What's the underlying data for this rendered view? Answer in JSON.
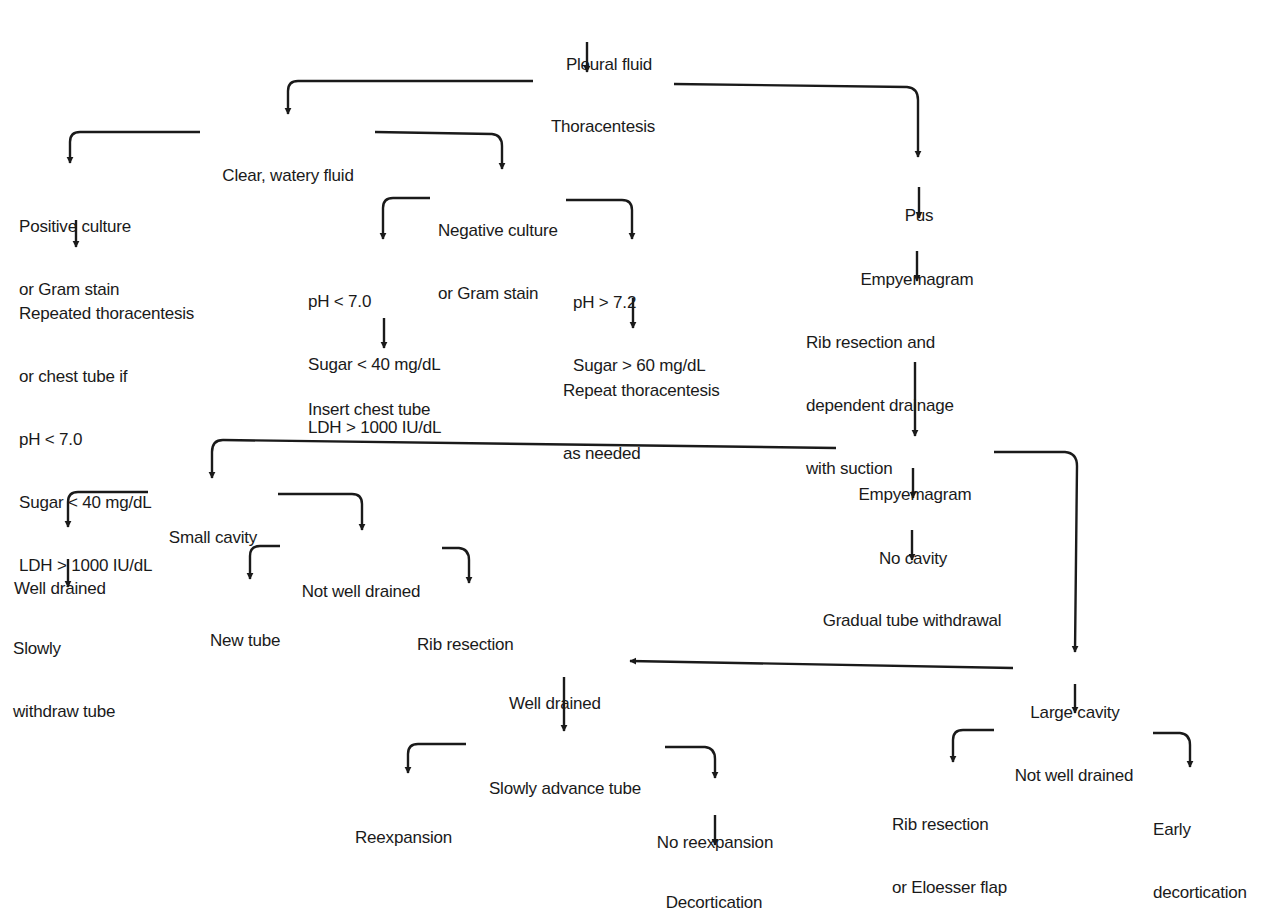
{
  "diagram": {
    "type": "flowchart",
    "colors": {
      "background": "#ffffff",
      "ink": "#1a1a1a"
    },
    "nodes": {
      "pleural_fluid": {
        "lines": [
          "Pleural fluid"
        ]
      },
      "thoracentesis": {
        "lines": [
          "Thoracentesis"
        ]
      },
      "clear_watery_fluid": {
        "lines": [
          "Clear, watery fluid"
        ]
      },
      "positive_culture": {
        "lines": [
          "Positive culture",
          "or Gram stain"
        ]
      },
      "repeated_thoracentesis": {
        "lines": [
          "Repeated thoracentesis",
          "or chest tube if",
          "pH < 7.0",
          "Sugar < 40 mg/dL",
          "LDH > 1000 IU/dL"
        ]
      },
      "negative_culture": {
        "lines": [
          "Negative culture",
          "or Gram stain"
        ]
      },
      "low_ph_criteria": {
        "lines": [
          "pH < 7.0",
          "Sugar < 40 mg/dL",
          "LDH > 1000 IU/dL"
        ]
      },
      "insert_chest_tube": {
        "lines": [
          "Insert chest tube"
        ]
      },
      "high_ph_criteria": {
        "lines": [
          "pH > 7.2",
          "Sugar > 60 mg/dL"
        ]
      },
      "repeat_thoracentesis": {
        "lines": [
          "Repeat thoracentesis",
          "as needed"
        ]
      },
      "pus": {
        "lines": [
          "Pus"
        ]
      },
      "empyemagram_1": {
        "lines": [
          "Empyemagram"
        ]
      },
      "rib_resection_drainage": {
        "lines": [
          "Rib resection and",
          "dependent drainage",
          "with suction"
        ]
      },
      "empyemagram_2": {
        "lines": [
          "Empyemagram"
        ]
      },
      "small_cavity": {
        "lines": [
          "Small cavity"
        ]
      },
      "small_well_drained": {
        "lines": [
          "Well drained"
        ]
      },
      "slowly_withdraw_tube": {
        "lines": [
          "Slowly",
          "withdraw tube"
        ]
      },
      "small_not_well_drained": {
        "lines": [
          "Not well drained"
        ]
      },
      "new_tube": {
        "lines": [
          "New tube"
        ]
      },
      "rib_resection": {
        "lines": [
          "Rib resection"
        ]
      },
      "no_cavity": {
        "lines": [
          "No cavity"
        ]
      },
      "gradual_tube_withdrawal": {
        "lines": [
          "Gradual tube withdrawal"
        ]
      },
      "large_cavity": {
        "lines": [
          "Large cavity"
        ]
      },
      "large_well_drained": {
        "lines": [
          "Well drained"
        ]
      },
      "slowly_advance_tube": {
        "lines": [
          "Slowly advance tube"
        ]
      },
      "reexpansion": {
        "lines": [
          "Reexpansion"
        ]
      },
      "no_reexpansion": {
        "lines": [
          "No reexpansion"
        ]
      },
      "decortication": {
        "lines": [
          "Decortication"
        ]
      },
      "large_not_well_drained": {
        "lines": [
          "Not well drained"
        ]
      },
      "rib_resection_eloesser": {
        "lines": [
          "Rib resection",
          "or Eloesser flap"
        ]
      },
      "early_decortication": {
        "lines": [
          "Early",
          "decortication"
        ]
      }
    },
    "edges": [
      [
        "pleural_fluid",
        "thoracentesis"
      ],
      [
        "thoracentesis",
        "clear_watery_fluid"
      ],
      [
        "thoracentesis",
        "pus"
      ],
      [
        "clear_watery_fluid",
        "positive_culture"
      ],
      [
        "clear_watery_fluid",
        "negative_culture"
      ],
      [
        "positive_culture",
        "repeated_thoracentesis"
      ],
      [
        "negative_culture",
        "low_ph_criteria"
      ],
      [
        "negative_culture",
        "high_ph_criteria"
      ],
      [
        "low_ph_criteria",
        "insert_chest_tube"
      ],
      [
        "high_ph_criteria",
        "repeat_thoracentesis"
      ],
      [
        "pus",
        "empyemagram_1"
      ],
      [
        "empyemagram_1",
        "rib_resection_drainage"
      ],
      [
        "rib_resection_drainage",
        "empyemagram_2"
      ],
      [
        "empyemagram_2",
        "small_cavity"
      ],
      [
        "empyemagram_2",
        "no_cavity"
      ],
      [
        "empyemagram_2",
        "large_cavity"
      ],
      [
        "small_cavity",
        "small_well_drained"
      ],
      [
        "small_cavity",
        "small_not_well_drained"
      ],
      [
        "small_well_drained",
        "slowly_withdraw_tube"
      ],
      [
        "small_not_well_drained",
        "new_tube"
      ],
      [
        "small_not_well_drained",
        "rib_resection"
      ],
      [
        "no_cavity",
        "gradual_tube_withdrawal"
      ],
      [
        "large_cavity",
        "large_well_drained"
      ],
      [
        "large_cavity",
        "large_not_well_drained"
      ],
      [
        "large_well_drained",
        "slowly_advance_tube"
      ],
      [
        "slowly_advance_tube",
        "reexpansion"
      ],
      [
        "slowly_advance_tube",
        "no_reexpansion"
      ],
      [
        "no_reexpansion",
        "decortication"
      ],
      [
        "large_not_well_drained",
        "rib_resection_eloesser"
      ],
      [
        "large_not_well_drained",
        "early_decortication"
      ]
    ]
  }
}
